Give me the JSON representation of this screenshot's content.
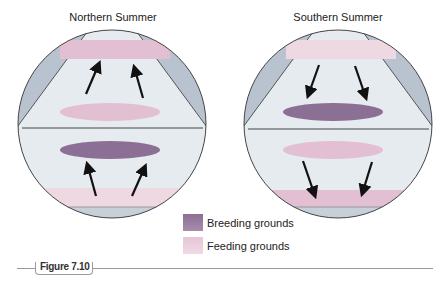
{
  "panels": [
    {
      "title": "Northern Summer",
      "arrow_direction": "north"
    },
    {
      "title": "Southern Summer",
      "arrow_direction": "south"
    }
  ],
  "legend": [
    {
      "label": "Breeding grounds",
      "color": "#8c6f94"
    },
    {
      "label": "Feeding grounds",
      "color": "#e6c5d6"
    }
  ],
  "figure": {
    "label": "Figure 7.10"
  },
  "colors": {
    "globe_side": "#b9c3cf",
    "globe_center": "#e6ebf0",
    "breeding": "#8c6f94",
    "feeding": "#e2bfd2",
    "outline": "#333333",
    "arrow": "#111111"
  }
}
